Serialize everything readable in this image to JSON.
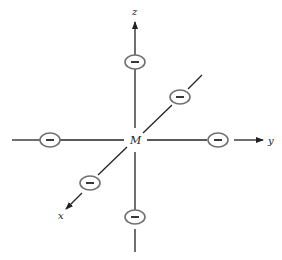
{
  "diagram": {
    "center_label": "M",
    "axes": [
      {
        "name": "x",
        "label": "x"
      },
      {
        "name": "y",
        "label": "y"
      },
      {
        "name": "z",
        "label": "z"
      }
    ],
    "ligands": [
      {
        "position": "+z",
        "charge": "−"
      },
      {
        "position": "−z",
        "charge": "−"
      },
      {
        "position": "+y",
        "charge": "−"
      },
      {
        "position": "−y",
        "charge": "−"
      },
      {
        "position": "+x",
        "charge": "−"
      },
      {
        "position": "−x",
        "charge": "−"
      }
    ],
    "colors": {
      "line": "#222222",
      "ligand_stroke": "#707070",
      "background": "#ffffff"
    }
  }
}
